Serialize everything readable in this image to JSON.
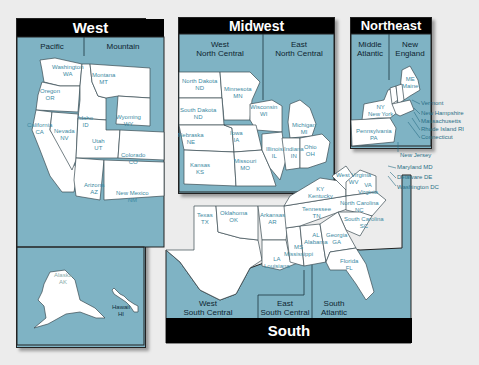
{
  "colors": {
    "water": "#7fb3c4",
    "land": "#ffffff",
    "title_bar": "#000000",
    "background": "#ececec",
    "label_text": "#3c8aa3"
  },
  "regions": {
    "west": {
      "title": "West",
      "divisions": [
        "Pacific",
        "Mountain"
      ]
    },
    "midwest": {
      "title": "Midwest",
      "divisions": [
        "West\nNorth Central",
        "East\nNorth Central"
      ]
    },
    "northeast": {
      "title": "Northeast",
      "divisions": [
        "Middle\nAtlantic",
        "New\nEngland"
      ]
    },
    "south": {
      "title": "South",
      "divisions": [
        "West\nSouth Central",
        "East\nSouth Central",
        "South\nAtlantic"
      ]
    }
  },
  "states": {
    "wa": {
      "name": "Washington",
      "abbr": "WA"
    },
    "or": {
      "name": "Oregon",
      "abbr": "OR"
    },
    "ca": {
      "name": "California",
      "abbr": "CA"
    },
    "nv": {
      "name": "Nevada",
      "abbr": "NV"
    },
    "id": {
      "name": "Idaho",
      "abbr": "ID"
    },
    "mt": {
      "name": "Montana",
      "abbr": "MT"
    },
    "wy": {
      "name": "Wyoming",
      "abbr": "WY"
    },
    "ut": {
      "name": "Utah",
      "abbr": "UT"
    },
    "co": {
      "name": "Colorado",
      "abbr": "CO"
    },
    "az": {
      "name": "Arizona",
      "abbr": "AZ"
    },
    "nm": {
      "name": "New Mexico",
      "abbr": "NM"
    },
    "ak": {
      "name": "Alaska",
      "abbr": "AK"
    },
    "hi": {
      "name": "Hawaii",
      "abbr": "HI"
    },
    "nd": {
      "name": "North Dakota",
      "abbr": "ND"
    },
    "sd": {
      "name": "South Dakota",
      "abbr": "ND"
    },
    "mn": {
      "name": "Minnesota",
      "abbr": "MN"
    },
    "ne": {
      "name": "Nebraska",
      "abbr": "NE"
    },
    "ia": {
      "name": "Iowa",
      "abbr": "IA"
    },
    "ks": {
      "name": "Kansas",
      "abbr": "KS"
    },
    "mo": {
      "name": "Missouri",
      "abbr": "MO"
    },
    "wi": {
      "name": "Wisconsin",
      "abbr": "WI"
    },
    "mi": {
      "name": "Michigan",
      "abbr": "MI"
    },
    "il": {
      "name": "Illinois",
      "abbr": "IL"
    },
    "in": {
      "name": "Indiana",
      "abbr": "IN"
    },
    "oh": {
      "name": "Ohio",
      "abbr": "OH"
    },
    "me": {
      "name": "Maine",
      "abbr": "ME"
    },
    "ny": {
      "name": "New York",
      "abbr": "NY"
    },
    "pa": {
      "name": "Pennsylvania",
      "abbr": "PA"
    },
    "vt": {
      "abbr": "VT"
    },
    "nh": {
      "abbr": "NH"
    },
    "tx": {
      "name": "Texas",
      "abbr": "TX"
    },
    "ok": {
      "name": "Oklahoma",
      "abbr": "OK"
    },
    "ar": {
      "name": "Arkansas",
      "abbr": "AR"
    },
    "la": {
      "name": "Louisiana",
      "abbr": "LA"
    },
    "ms": {
      "name": "Mississippi",
      "abbr": "MS"
    },
    "al": {
      "name": "Alabama",
      "abbr": "AL"
    },
    "tn": {
      "name": "Tennessee",
      "abbr": "TN"
    },
    "ky": {
      "name": "Kentucky",
      "abbr": "KY"
    },
    "ga": {
      "name": "Georgia",
      "abbr": "GA"
    },
    "fl": {
      "name": "Florida",
      "abbr": "FL"
    },
    "sc": {
      "name": "South Carolina",
      "abbr": "SC"
    },
    "nc": {
      "name": "North Carolina",
      "abbr": "NC"
    },
    "va": {
      "name": "Virginia",
      "abbr": "VA"
    },
    "wv": {
      "name": "West Virginia",
      "abbr": "WV"
    }
  },
  "callouts": [
    "Vermont",
    "New Hampshire",
    "Massachusetts",
    "Rhode Island  RI",
    "Connecticut",
    "New Jersey",
    "Maryland  MD",
    "Delaware  DE",
    "Washington  DC"
  ]
}
